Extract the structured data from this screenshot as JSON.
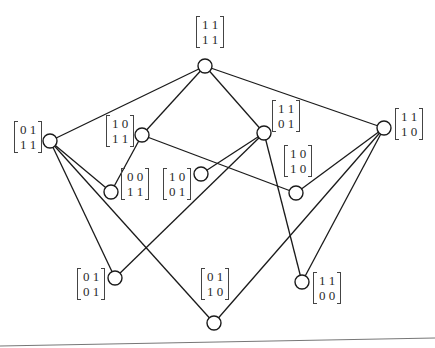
{
  "diagram": {
    "type": "lattice",
    "nodes": [
      {
        "id": "n11_11",
        "x": 205,
        "y": 66,
        "r": 7,
        "matrix": {
          "row1": "1 1",
          "row2": "1 1"
        },
        "label_x": 196,
        "label_y": 16
      },
      {
        "id": "n01_11",
        "x": 50,
        "y": 141,
        "r": 7,
        "matrix": {
          "row1": "0 1",
          "row2": "1 1"
        },
        "label_x": 14,
        "label_y": 121
      },
      {
        "id": "n10_11",
        "x": 142,
        "y": 135,
        "r": 7,
        "matrix": {
          "row1": "1 0",
          "row2": "1 1"
        },
        "label_x": 106,
        "label_y": 115
      },
      {
        "id": "n11_01",
        "x": 264,
        "y": 133,
        "r": 7,
        "matrix": {
          "row1": "1 1",
          "row2": "0 1"
        },
        "label_x": 272,
        "label_y": 100
      },
      {
        "id": "n11_10",
        "x": 384,
        "y": 128,
        "r": 7,
        "matrix": {
          "row1": "1 1",
          "row2": "1 0"
        },
        "label_x": 395,
        "label_y": 108
      },
      {
        "id": "n00_11",
        "x": 111,
        "y": 192,
        "r": 7,
        "matrix": {
          "row1": "0 0",
          "row2": "1 1"
        },
        "label_x": 121,
        "label_y": 168
      },
      {
        "id": "n10_01",
        "x": 201,
        "y": 174,
        "r": 7,
        "matrix": {
          "row1": "1 0",
          "row2": "0 1"
        },
        "label_x": 163,
        "label_y": 168
      },
      {
        "id": "n10_10",
        "x": 296,
        "y": 193,
        "r": 7,
        "matrix": {
          "row1": "1 0",
          "row2": "1 0"
        },
        "label_x": 284,
        "label_y": 145
      },
      {
        "id": "n01_01",
        "x": 115,
        "y": 278,
        "r": 7,
        "matrix": {
          "row1": "0 1",
          "row2": "0 1"
        },
        "label_x": 77,
        "label_y": 268
      },
      {
        "id": "n01_10",
        "x": 214,
        "y": 323,
        "r": 7,
        "matrix": {
          "row1": "0 1",
          "row2": "1 0"
        },
        "label_x": 201,
        "label_y": 268
      },
      {
        "id": "n11_00",
        "x": 302,
        "y": 282,
        "r": 7,
        "matrix": {
          "row1": "1 1",
          "row2": "0 0"
        },
        "label_x": 313,
        "label_y": 272
      }
    ],
    "edges": [
      [
        "n11_11",
        "n01_11"
      ],
      [
        "n11_11",
        "n10_11"
      ],
      [
        "n11_11",
        "n11_01"
      ],
      [
        "n11_11",
        "n11_10"
      ],
      [
        "n01_11",
        "n00_11"
      ],
      [
        "n01_11",
        "n01_01"
      ],
      [
        "n01_11",
        "n01_10"
      ],
      [
        "n10_11",
        "n00_11"
      ],
      [
        "n10_11",
        "n10_10"
      ],
      [
        "n11_01",
        "n10_01"
      ],
      [
        "n11_01",
        "n01_01"
      ],
      [
        "n11_01",
        "n11_00"
      ],
      [
        "n11_10",
        "n10_10"
      ],
      [
        "n11_10",
        "n01_10"
      ],
      [
        "n11_10",
        "n11_00"
      ]
    ],
    "bottom_rule": {
      "x1": 0,
      "y1": 346,
      "x2": 435,
      "y2": 338
    }
  }
}
